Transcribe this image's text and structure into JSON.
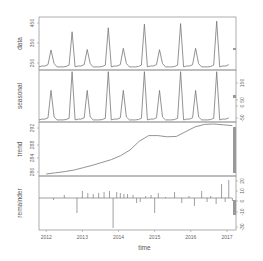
{
  "chart_data": {
    "type": "line",
    "title": "",
    "subtitle": "STL decomposition",
    "xlabel": "time",
    "x_ticks": [
      "2012",
      "2013",
      "2014",
      "2015",
      "2016",
      "2017"
    ],
    "x_range": [
      2011.8,
      2017.25
    ],
    "frequency": 12,
    "grid": false,
    "legend": null,
    "panels": [
      {
        "name": "data",
        "ylabel": "data",
        "left_ticks": [
          "250",
          "350",
          "450"
        ],
        "right_ticks": [],
        "ylim": [
          235,
          460
        ],
        "peaks_small": [
          320,
          322,
          327,
          321,
          327,
          332
        ],
        "peaks_large": [
          397,
          414,
          430,
          432,
          442,
          452
        ],
        "baseline": 248
      },
      {
        "name": "seasonal",
        "ylabel": "seasonal",
        "left_ticks": [],
        "right_ticks": [
          "-50",
          "0",
          "50",
          "150"
        ],
        "ylim": [
          -60,
          190
        ],
        "peaks_small": 92,
        "peaks_large": 182,
        "baseline": -50
      },
      {
        "name": "trend",
        "ylabel": "trend",
        "left_ticks": [
          "280",
          "284",
          "288",
          "292"
        ],
        "right_ticks": [],
        "ylim": [
          279.5,
          293
        ],
        "values": [
          280,
          280.3,
          280.6,
          281,
          281.6,
          282.2,
          282.9,
          283.6,
          284.6,
          286,
          288.2,
          289.6,
          289.6,
          289.3,
          289.4,
          290.6,
          291.8,
          292.4,
          292.5,
          292.3,
          292.1
        ]
      },
      {
        "name": "remainder",
        "ylabel": "remainder",
        "left_ticks": [],
        "right_ticks": [
          "-30",
          "-10",
          "0",
          "10",
          "20"
        ],
        "ylim": [
          -32,
          22
        ],
        "spikes": [
          {
            "x": 2012.2,
            "v": -2
          },
          {
            "x": 2012.5,
            "v": 3
          },
          {
            "x": 2012.85,
            "v": -15
          },
          {
            "x": 2013.0,
            "v": 7
          },
          {
            "x": 2013.15,
            "v": 5
          },
          {
            "x": 2013.3,
            "v": 4
          },
          {
            "x": 2013.45,
            "v": 5
          },
          {
            "x": 2013.6,
            "v": 6
          },
          {
            "x": 2013.75,
            "v": 7
          },
          {
            "x": 2013.85,
            "v": -30
          },
          {
            "x": 2013.95,
            "v": 6
          },
          {
            "x": 2014.05,
            "v": 5
          },
          {
            "x": 2014.15,
            "v": 4
          },
          {
            "x": 2014.25,
            "v": 4
          },
          {
            "x": 2014.4,
            "v": 3
          },
          {
            "x": 2014.5,
            "v": -5
          },
          {
            "x": 2014.6,
            "v": -4
          },
          {
            "x": 2014.75,
            "v": 2
          },
          {
            "x": 2014.9,
            "v": 3
          },
          {
            "x": 2015.0,
            "v": -15
          },
          {
            "x": 2015.1,
            "v": 5
          },
          {
            "x": 2015.3,
            "v": 1
          },
          {
            "x": 2015.55,
            "v": 6
          },
          {
            "x": 2015.75,
            "v": -5
          },
          {
            "x": 2015.95,
            "v": 2
          },
          {
            "x": 2016.1,
            "v": -8
          },
          {
            "x": 2016.3,
            "v": 7
          },
          {
            "x": 2016.45,
            "v": -4
          },
          {
            "x": 2016.55,
            "v": 2
          },
          {
            "x": 2016.7,
            "v": -6
          },
          {
            "x": 2016.85,
            "v": 14
          },
          {
            "x": 2016.95,
            "v": -4
          },
          {
            "x": 2017.05,
            "v": 18
          },
          {
            "x": 2017.15,
            "v": -3
          }
        ]
      }
    ],
    "scale_bars": "grey range bars on right edge of each panel indicating relative scale"
  }
}
